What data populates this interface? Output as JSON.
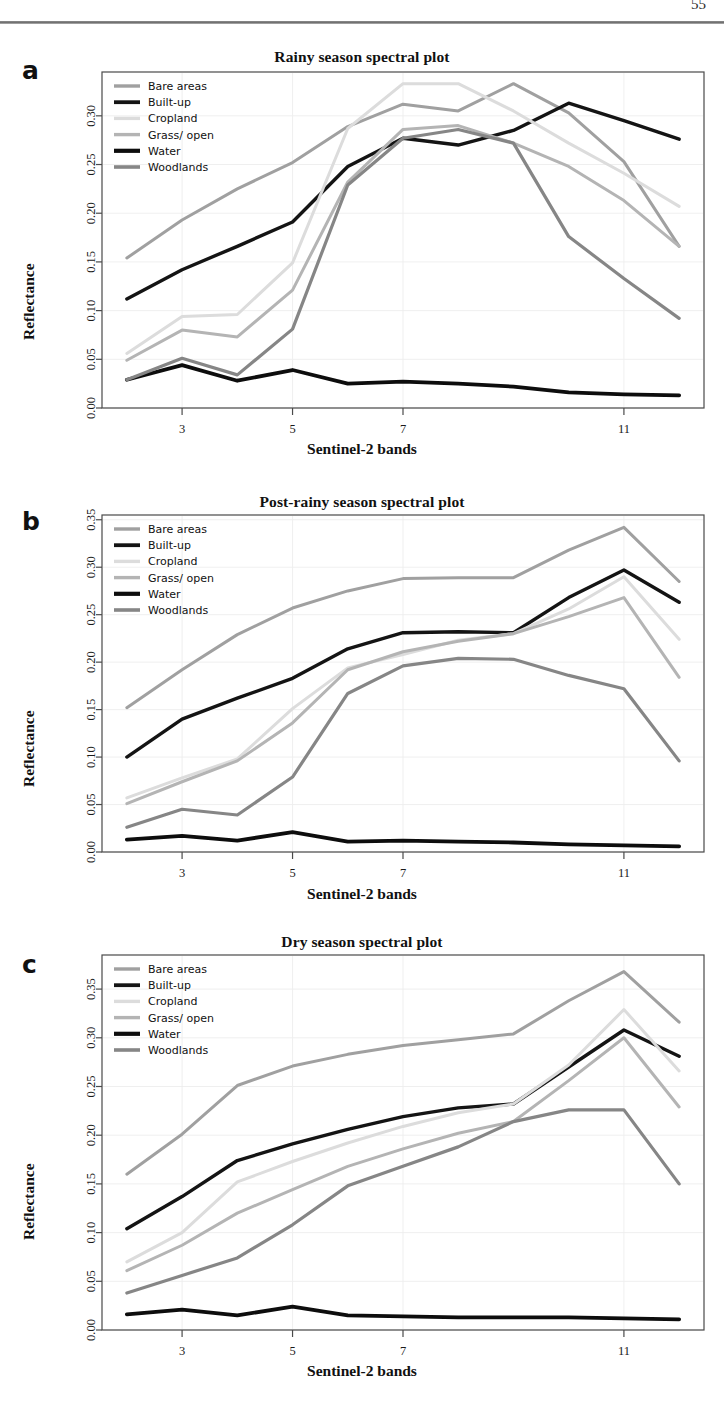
{
  "page": {
    "number": "55"
  },
  "series_meta": [
    {
      "key": "bare_areas",
      "label": "Bare areas",
      "color": "#a0a0a0",
      "width": 3.0
    },
    {
      "key": "built_up",
      "label": "Built-up",
      "color": "#141414",
      "width": 3.4
    },
    {
      "key": "cropland",
      "label": "Cropland",
      "color": "#dcdcdc",
      "width": 3.0
    },
    {
      "key": "grass_open",
      "label": "Grass/ open",
      "color": "#b4b4b4",
      "width": 3.0
    },
    {
      "key": "water",
      "label": "Water",
      "color": "#0d0d0d",
      "width": 3.8
    },
    {
      "key": "woodlands",
      "label": "Woodlands",
      "color": "#868686",
      "width": 3.2
    }
  ],
  "panels": [
    {
      "letter": "a",
      "title": "Rainy season spectral plot",
      "xlabel": "Sentinel-2 bands",
      "ylabel": "Reflectance"
    },
    {
      "letter": "b",
      "title": "Post-rainy season spectral plot",
      "xlabel": "Sentinel-2 bands",
      "ylabel": "Reflectance"
    },
    {
      "letter": "c",
      "title": "Dry season spectral plot",
      "xlabel": "Sentinel-2 bands",
      "ylabel": "Reflectance"
    }
  ],
  "chart_data": [
    {
      "type": "line",
      "panel": "a",
      "title": "Rainy season spectral plot",
      "xlabel": "Sentinel-2 bands",
      "ylabel": "Reflectance",
      "x": [
        2,
        3,
        4,
        5,
        6,
        7,
        8,
        9,
        10,
        11,
        12
      ],
      "xticks": [
        3,
        5,
        7,
        11
      ],
      "xlim": [
        1.55,
        12.45
      ],
      "ylim": [
        0.0,
        0.345
      ],
      "yticks": [
        0.0,
        0.05,
        0.1,
        0.15,
        0.2,
        0.25,
        0.3
      ],
      "grid": true,
      "legend_position": "top-left",
      "series": [
        {
          "name": "Bare areas",
          "key": "bare_areas",
          "values": [
            0.154,
            0.193,
            0.225,
            0.252,
            0.289,
            0.312,
            0.305,
            0.333,
            0.303,
            0.253,
            0.166
          ]
        },
        {
          "name": "Built-up",
          "key": "built_up",
          "values": [
            0.112,
            0.142,
            0.166,
            0.191,
            0.248,
            0.277,
            0.27,
            0.285,
            0.313,
            0.295,
            0.276
          ]
        },
        {
          "name": "Cropland",
          "key": "cropland",
          "values": [
            0.056,
            0.094,
            0.096,
            0.149,
            0.287,
            0.333,
            0.333,
            0.305,
            0.272,
            0.241,
            0.207
          ]
        },
        {
          "name": "Grass/ open",
          "key": "grass_open",
          "values": [
            0.049,
            0.08,
            0.073,
            0.121,
            0.232,
            0.286,
            0.29,
            0.272,
            0.248,
            0.213,
            0.166
          ]
        },
        {
          "name": "Water",
          "key": "water",
          "values": [
            0.029,
            0.044,
            0.028,
            0.039,
            0.025,
            0.027,
            0.025,
            0.022,
            0.016,
            0.014,
            0.013
          ]
        },
        {
          "name": "Woodlands",
          "key": "woodlands",
          "values": [
            0.029,
            0.051,
            0.034,
            0.081,
            0.229,
            0.277,
            0.286,
            0.272,
            0.176,
            0.133,
            0.092
          ]
        }
      ]
    },
    {
      "type": "line",
      "panel": "b",
      "title": "Post-rainy season spectral plot",
      "xlabel": "Sentinel-2 bands",
      "ylabel": "Reflectance",
      "x": [
        2,
        3,
        4,
        5,
        6,
        7,
        8,
        9,
        10,
        11,
        12
      ],
      "xticks": [
        3,
        5,
        7,
        11
      ],
      "xlim": [
        1.55,
        12.45
      ],
      "ylim": [
        0.0,
        0.355
      ],
      "yticks": [
        0.0,
        0.05,
        0.1,
        0.15,
        0.2,
        0.25,
        0.3,
        0.35
      ],
      "grid": true,
      "legend_position": "top-left",
      "series": [
        {
          "name": "Bare areas",
          "key": "bare_areas",
          "values": [
            0.152,
            0.192,
            0.229,
            0.257,
            0.275,
            0.288,
            0.289,
            0.289,
            0.318,
            0.342,
            0.285
          ]
        },
        {
          "name": "Built-up",
          "key": "built_up",
          "values": [
            0.1,
            0.14,
            0.162,
            0.183,
            0.214,
            0.231,
            0.232,
            0.231,
            0.268,
            0.297,
            0.263
          ]
        },
        {
          "name": "Cropland",
          "key": "cropland",
          "values": [
            0.057,
            0.078,
            0.098,
            0.151,
            0.194,
            0.208,
            0.223,
            0.23,
            0.256,
            0.29,
            0.224
          ]
        },
        {
          "name": "Grass/ open",
          "key": "grass_open",
          "values": [
            0.051,
            0.074,
            0.096,
            0.136,
            0.192,
            0.211,
            0.222,
            0.23,
            0.248,
            0.268,
            0.184
          ]
        },
        {
          "name": "Water",
          "key": "water",
          "values": [
            0.013,
            0.017,
            0.012,
            0.021,
            0.011,
            0.012,
            0.011,
            0.01,
            0.008,
            0.007,
            0.006
          ]
        },
        {
          "name": "Woodlands",
          "key": "woodlands",
          "values": [
            0.026,
            0.045,
            0.039,
            0.079,
            0.167,
            0.196,
            0.204,
            0.203,
            0.186,
            0.172,
            0.096
          ]
        }
      ]
    },
    {
      "type": "line",
      "panel": "c",
      "title": "Dry season spectral plot",
      "xlabel": "Sentinel-2 bands",
      "ylabel": "Reflectance",
      "x": [
        2,
        3,
        4,
        5,
        6,
        7,
        8,
        9,
        10,
        11,
        12
      ],
      "xticks": [
        3,
        5,
        7,
        11
      ],
      "xlim": [
        1.55,
        12.45
      ],
      "ylim": [
        0.0,
        0.385
      ],
      "yticks": [
        0.0,
        0.05,
        0.1,
        0.15,
        0.2,
        0.25,
        0.3,
        0.35
      ],
      "grid": true,
      "legend_position": "top-left",
      "series": [
        {
          "name": "Bare areas",
          "key": "bare_areas",
          "values": [
            0.16,
            0.201,
            0.251,
            0.271,
            0.283,
            0.292,
            0.298,
            0.304,
            0.338,
            0.368,
            0.316
          ]
        },
        {
          "name": "Built-up",
          "key": "built_up",
          "values": [
            0.104,
            0.137,
            0.174,
            0.191,
            0.206,
            0.219,
            0.228,
            0.232,
            0.27,
            0.308,
            0.281
          ]
        },
        {
          "name": "Cropland",
          "key": "cropland",
          "values": [
            0.07,
            0.1,
            0.152,
            0.173,
            0.192,
            0.209,
            0.223,
            0.232,
            0.272,
            0.329,
            0.266
          ]
        },
        {
          "name": "Grass/ open",
          "key": "grass_open",
          "values": [
            0.061,
            0.087,
            0.12,
            0.144,
            0.168,
            0.186,
            0.202,
            0.214,
            0.256,
            0.3,
            0.229
          ]
        },
        {
          "name": "Water",
          "key": "water",
          "values": [
            0.016,
            0.021,
            0.015,
            0.024,
            0.015,
            0.014,
            0.013,
            0.013,
            0.013,
            0.012,
            0.011
          ]
        },
        {
          "name": "Woodlands",
          "key": "woodlands",
          "values": [
            0.038,
            0.056,
            0.074,
            0.108,
            0.148,
            0.168,
            0.188,
            0.214,
            0.226,
            0.226,
            0.15
          ]
        }
      ]
    }
  ]
}
